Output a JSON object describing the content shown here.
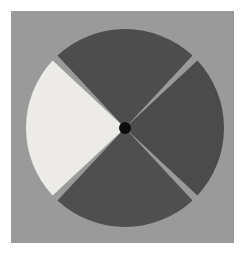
{
  "figure": {
    "canvas": {
      "width": 245,
      "height": 254,
      "background_color": "#ffffff"
    },
    "panel": {
      "name": "gray-square-panel",
      "x": 11,
      "y": 11,
      "width": 223,
      "height": 232,
      "fill_color": "#9a9a9a",
      "edge_color": "#8f8f8f"
    },
    "disc": {
      "center_x": 125,
      "center_y": 128,
      "radius": 99,
      "gap_color": "#9a9a9a",
      "sector_count": 4,
      "sector_span_degrees": 86,
      "gap_span_degrees": 4,
      "rotation_offset_degrees": 45
    },
    "hub": {
      "name": "center-hub",
      "center_x": 125,
      "center_y": 128,
      "radius": 6,
      "fill_color": "#0d0d0d"
    },
    "sectors": [
      {
        "label": "top-sector",
        "position": "top",
        "start_angle": 227,
        "end_angle": 313,
        "fill_color": "#4d4d4d",
        "tone": "dark"
      },
      {
        "label": "right-sector",
        "position": "right",
        "start_angle": 317,
        "end_angle": 43,
        "fill_color": "#4b4b4b",
        "tone": "dark"
      },
      {
        "label": "bottom-sector",
        "position": "bottom",
        "start_angle": 47,
        "end_angle": 133,
        "fill_color": "#4f4f4f",
        "tone": "dark"
      },
      {
        "label": "left-sector",
        "position": "left",
        "start_angle": 137,
        "end_angle": 223,
        "fill_color": "#edebe7",
        "tone": "light"
      }
    ]
  }
}
